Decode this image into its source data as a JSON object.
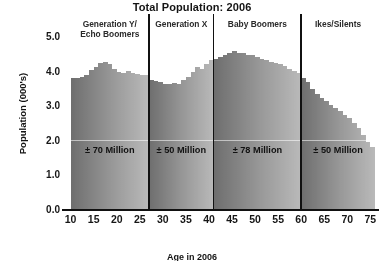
{
  "chart_data": {
    "type": "bar",
    "title": "Total Population: 2006",
    "xlabel": "",
    "ylabel": "Population (000's)",
    "xlim": [
      9,
      76
    ],
    "ylim": [
      0,
      5
    ],
    "grid": false,
    "legend": "none",
    "y_ticks": [
      "5.0",
      "4.0",
      "3.0",
      "2.0",
      "1.0",
      "0.0"
    ],
    "y_tick_values": [
      5,
      4,
      3,
      2,
      1,
      0
    ],
    "x_ticks": [
      "10",
      "15",
      "20",
      "25",
      "30",
      "35",
      "40",
      "45",
      "50",
      "55",
      "60",
      "65",
      "70",
      "75"
    ],
    "x_tick_values": [
      10,
      15,
      20,
      25,
      30,
      35,
      40,
      45,
      50,
      55,
      60,
      65,
      70,
      75
    ],
    "bar_unit_width": 1,
    "x": [
      10,
      11,
      12,
      13,
      14,
      15,
      16,
      17,
      18,
      19,
      20,
      21,
      22,
      23,
      24,
      25,
      26,
      27,
      28,
      29,
      30,
      31,
      32,
      33,
      34,
      35,
      36,
      37,
      38,
      39,
      40,
      41,
      42,
      43,
      44,
      45,
      46,
      47,
      48,
      49,
      50,
      51,
      52,
      53,
      54,
      55,
      56,
      57,
      58,
      59,
      60,
      61,
      62,
      63,
      64,
      65,
      66,
      67,
      68,
      69,
      70,
      71,
      72,
      73,
      74,
      75
    ],
    "values": [
      3.78,
      3.8,
      3.82,
      3.88,
      4.02,
      4.1,
      4.22,
      4.24,
      4.18,
      4.06,
      3.96,
      3.92,
      3.98,
      3.92,
      3.9,
      3.86,
      3.88,
      3.72,
      3.7,
      3.66,
      3.62,
      3.62,
      3.64,
      3.62,
      3.72,
      3.82,
      3.96,
      4.1,
      4.06,
      4.18,
      4.3,
      4.34,
      4.4,
      4.44,
      4.5,
      4.58,
      4.52,
      4.5,
      4.46,
      4.44,
      4.4,
      4.34,
      4.3,
      4.26,
      4.22,
      4.18,
      4.12,
      4.06,
      4.0,
      3.94,
      3.8,
      3.66,
      3.46,
      3.32,
      3.22,
      3.12,
      3.02,
      2.92,
      2.82,
      2.72,
      2.62,
      2.5,
      2.34,
      2.14,
      1.94,
      1.8
    ],
    "segments": [
      {
        "name": "Generation Y/ Echo Boomers",
        "label": "Generation Y/\nEcho Boomers",
        "annotation": "± 70 Million",
        "x_start": 10,
        "x_end": 27
      },
      {
        "name": "Generation X",
        "label": "Generation X",
        "annotation": "± 50 Million",
        "x_start": 27,
        "x_end": 41
      },
      {
        "name": "Baby Boomers",
        "label": "Baby Boomers",
        "annotation": "± 78 Million",
        "x_start": 41,
        "x_end": 60
      },
      {
        "name": "Ikes/Silents",
        "label": "Ikes/Silents",
        "annotation": "± 50 Million",
        "x_start": 60,
        "x_end": 76
      }
    ],
    "colors": {
      "bar_dark": "#6e6e6e",
      "bar_light": "#c8c8c8",
      "axis": "#111111",
      "divider": "#111111",
      "text": "#141414",
      "background": "#ffffff"
    }
  },
  "caption": {
    "text": "Age in 2006"
  }
}
